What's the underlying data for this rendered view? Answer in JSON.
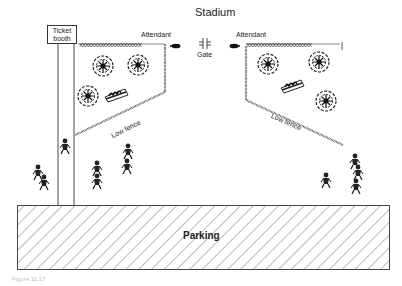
{
  "diagram": {
    "title": "Stadium",
    "ticket_booth": {
      "line1": "Ticket",
      "line2": "booth"
    },
    "gate_label": "Gate",
    "attendant_left_label": "Attendant",
    "attendant_right_label": "Attendant",
    "low_fence_left_label": "Low fence",
    "low_fence_right_label": "Low fence",
    "parking_label": "Parking",
    "caption": "Figure 11.17",
    "icons": {
      "gate": "gate-symbol",
      "attendant": "person-icon",
      "shrub": "shrub-icon",
      "planter": "planter-icon",
      "pedestrian": "pedestrian-icon"
    },
    "colors": {
      "line": "#333333",
      "background": "#ffffff",
      "hatch": "#555555"
    }
  }
}
